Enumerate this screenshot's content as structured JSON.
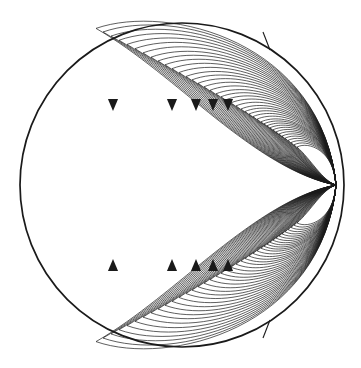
{
  "figure": {
    "name": "dipole-field-lines-in-sphere",
    "title": "",
    "background_color": "#ffffff",
    "ink_color": "#1a1a1a",
    "width": 361,
    "height": 368
  },
  "chart_data": {
    "type": "line",
    "title": "",
    "subtitle": "",
    "xlabel": "",
    "ylabel": "",
    "grid": false,
    "legend": null,
    "axis_visible": false,
    "tick_labels": [],
    "annotations": [],
    "boundary_circle": {
      "name": "outer-circle",
      "center_x": 182,
      "center_y": 185,
      "radius": 162,
      "stroke_width": 1.7
    },
    "convergence_point": {
      "name": "focus-point",
      "x": 336,
      "y": 185
    },
    "field_lines": {
      "count_per_hemisphere": 40,
      "hemispheres": [
        "upper",
        "lower"
      ],
      "stroke_width": 0.7,
      "leftmost_extent_x": 96,
      "topmost_extent_y": 26,
      "bottommost_extent_y": 344,
      "apex_x_values": [
        96,
        103,
        111,
        119,
        127,
        135,
        143,
        151,
        158,
        165,
        172,
        179,
        186,
        192,
        198,
        204,
        210,
        216,
        221,
        226,
        231,
        236,
        241,
        245,
        249,
        253,
        257,
        261,
        264,
        267,
        270,
        273,
        276,
        279,
        282,
        285,
        288,
        291,
        294,
        297
      ]
    },
    "arrowheads": {
      "count_per_hemisphere": 5,
      "upper": {
        "direction": "down",
        "y": 105,
        "x_values": [
          113,
          172,
          196,
          213,
          228
        ]
      },
      "lower": {
        "direction": "up",
        "y": 265,
        "x_values": [
          113,
          172,
          196,
          213,
          228
        ]
      },
      "size": 11
    },
    "tick_marks": [
      {
        "name": "tick-upper-right",
        "angle_deg": 56,
        "inner_x": 270,
        "inner_y": 50,
        "outer_x": 263,
        "outer_y": 32
      },
      {
        "name": "tick-lower-right",
        "angle_deg": -56,
        "inner_x": 270,
        "inner_y": 320,
        "outer_x": 263,
        "outer_y": 338
      }
    ]
  }
}
